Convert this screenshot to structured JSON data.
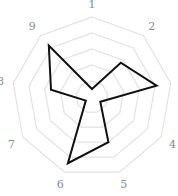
{
  "chart_data": {
    "type": "radar",
    "title": "",
    "categories": [
      "1",
      "2",
      "3",
      "4",
      "5",
      "6",
      "7",
      "8",
      "9"
    ],
    "series": [
      {
        "name": "",
        "values": [
          0.5,
          2.8,
          4.1,
          0.6,
          3.0,
          4.4,
          0.45,
          2.6,
          4.2
        ]
      }
    ],
    "rlim": [
      0,
      5
    ],
    "rings": 5,
    "grid": true,
    "legend": false,
    "colors": {
      "line": "#111111",
      "grid": "#e2e2e2",
      "label": "#8a8a8a"
    }
  }
}
